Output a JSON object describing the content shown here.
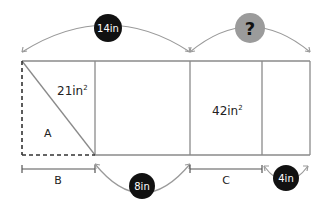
{
  "diagram": {
    "colors": {
      "line": "#8a8a8a",
      "badge_dark": "#111111",
      "badge_unknown": "#9b9b9b",
      "text": "#222222"
    },
    "rectangle": {
      "triangle_area": "21in",
      "triangle_area_exp": "2",
      "right_section_area": "42in",
      "right_section_area_exp": "2",
      "triangle_label": "A"
    },
    "top_dimensions": {
      "left_badge": "14in",
      "right_badge": "?"
    },
    "bottom_dimensions": {
      "b_label": "B",
      "middle_badge": "8in",
      "c_label": "C",
      "right_badge": "4in"
    }
  }
}
